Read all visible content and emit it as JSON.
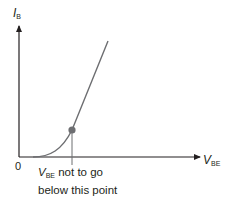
{
  "diagram": {
    "title": "",
    "y_axis": {
      "symbol": "I",
      "subscript": "B"
    },
    "x_axis": {
      "symbol": "V",
      "subscript": "BE"
    },
    "origin_label": "0",
    "annotation": {
      "symbol": "V",
      "subscript": "BE",
      "line1_rest": "not to go",
      "line2": "below this point"
    },
    "colors": {
      "axis": "#231f20",
      "curve": "#6d6e71",
      "dot": "#6d6e71",
      "marker_line": "#6d6e71"
    }
  }
}
